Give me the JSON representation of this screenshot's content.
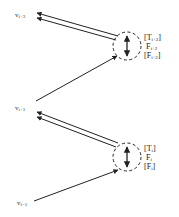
{
  "diagram": {
    "nodes": [
      {
        "id": "v_i+3",
        "base": "v",
        "sub": "i+3"
      },
      {
        "id": "v_i+1",
        "base": "v",
        "sub": "i+1"
      },
      {
        "id": "v_i-1",
        "base": "v",
        "sub": "i−1"
      }
    ],
    "junctions": [
      {
        "id": "upper",
        "labels": [
          {
            "open": "[",
            "base": "T",
            "sub": "i+2",
            "close": "]"
          },
          {
            "open": "",
            "base": "F",
            "sub": "i+2",
            "close": ""
          },
          {
            "open": "[",
            "base": "F",
            "sub": "i+2",
            "close": "]"
          }
        ]
      },
      {
        "id": "lower",
        "labels": [
          {
            "open": "[",
            "base": "T",
            "sub": "i",
            "close": "]"
          },
          {
            "open": "",
            "base": "F",
            "sub": "i",
            "close": ""
          },
          {
            "open": "[",
            "base": "F",
            "sub": "i",
            "close": "]"
          }
        ]
      }
    ],
    "colors": {
      "stroke": "#222222",
      "background": "#ffffff"
    }
  }
}
